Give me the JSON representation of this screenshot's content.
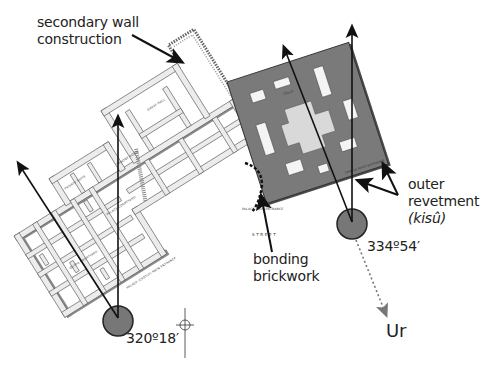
{
  "diagram": {
    "annotations": {
      "secondary_wall_line1": "secondary wall",
      "secondary_wall_line2": "construction",
      "outer_line1": "outer",
      "outer_line2": "revetment",
      "outer_line3": "(kisû)",
      "bonding_line1": "bonding",
      "bonding_line2": "brickwork",
      "angle_left": "320º18′",
      "angle_right": "334º54′",
      "destination": "Ur"
    },
    "plan_labels": {
      "great_hall": "GREAT HALL",
      "palace_courtyard": "PALACE COURTYARD",
      "throne_room": "THRONE ROOM",
      "private_suite": "PRIVATE SUITE",
      "outer_courtyard": "OUTER COURTYARD",
      "palace_castle_entrance": "PALACE (CASTLE) MAIN ENTRANCE",
      "palace_main_entrance": "PALACE MAIN ENTRANCE",
      "temple_main_entrance": "TEMPLE MAIN ENTRANCE",
      "street": "S T R E E T",
      "cella": "CELLA"
    },
    "colors": {
      "background": "#ffffff",
      "palace_walls": "#e6e6e6",
      "palace_wall_shadow": "#8a8a8a",
      "temple_fill": "#7a7a7a",
      "temple_courtyard": "#d8d8d8",
      "pivot_circle": "#777777",
      "arrow": "#111111",
      "text": "#222222"
    }
  }
}
